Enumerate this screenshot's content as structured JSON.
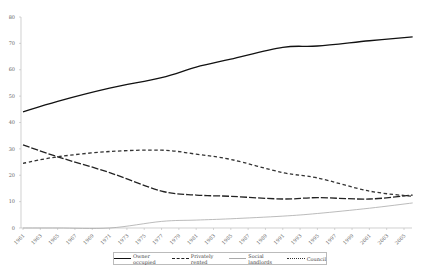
{
  "chart_data": {
    "type": "line",
    "title": "",
    "xlabel": "",
    "ylabel": "",
    "ylim": [
      0,
      80
    ],
    "y_ticks": [
      0,
      10,
      20,
      30,
      40,
      50,
      60,
      70,
      80
    ],
    "x_tick_labels": [
      "1961",
      "1963",
      "1965",
      "1967",
      "1969",
      "1971",
      "1973",
      "1975",
      "1977",
      "1979",
      "1981",
      "1983",
      "1985",
      "1987",
      "1989",
      "1991",
      "1993",
      "1995",
      "1997",
      "1999",
      "2001",
      "2003",
      "2005"
    ],
    "grid": false,
    "legend_position": "bottom",
    "x": [
      1961,
      1965,
      1971,
      1977,
      1981,
      1985,
      1991,
      1995,
      2001,
      2006
    ],
    "series": [
      {
        "name": "Owner occupied",
        "style": "solid",
        "color": "#111111",
        "values": [
          44,
          48,
          53,
          57,
          61,
          64,
          68.5,
          69,
          71,
          72.5
        ]
      },
      {
        "name": "Privately rented",
        "style": "long-dash",
        "color": "#222222",
        "values": [
          31.5,
          27,
          21,
          14,
          12.5,
          12,
          11,
          11.5,
          11,
          12.5
        ]
      },
      {
        "name": "Social landlords",
        "style": "thin-solid",
        "color": "#aaaaaa",
        "values": [
          0,
          0,
          0,
          2.5,
          3,
          3.5,
          4.5,
          5.5,
          7.5,
          9.5
        ]
      },
      {
        "name": "Council",
        "style": "short-dash",
        "color": "#333333",
        "values": [
          24.5,
          27,
          29,
          29.5,
          28,
          26,
          21,
          19,
          14,
          12
        ]
      }
    ]
  },
  "legend": {
    "items": [
      "Owner occupied",
      "Privately rented",
      "Social landlords",
      "Council"
    ]
  }
}
